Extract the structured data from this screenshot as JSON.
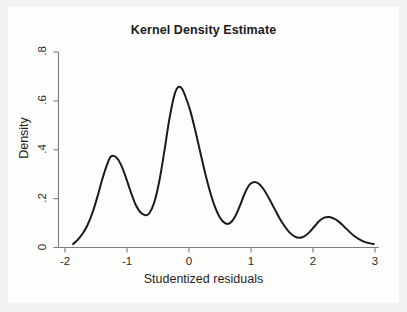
{
  "chart_data": {
    "type": "line",
    "title": "Kernel Density Estimate",
    "xlabel": "Studentized residuals",
    "ylabel": "Density",
    "xlim": [
      -2.0,
      3.0
    ],
    "ylim": [
      0.0,
      0.8
    ],
    "grid": false,
    "legend": null,
    "xticks": [
      "-2",
      "-1",
      "0",
      "1",
      "2",
      "3"
    ],
    "xtick_values": [
      -2,
      -1,
      0,
      1,
      2,
      3
    ],
    "yticks": [
      "0",
      ".2",
      ".4",
      ".6",
      ".8"
    ],
    "ytick_values": [
      0,
      0.2,
      0.4,
      0.6,
      0.8
    ],
    "series_name": "kdensity",
    "line_color": "#1a1a1a",
    "line_width": 2.0,
    "x": [
      -1.87,
      -1.8,
      -1.72,
      -1.64,
      -1.56,
      -1.48,
      -1.4,
      -1.32,
      -1.26,
      -1.18,
      -1.1,
      -1.02,
      -0.94,
      -0.86,
      -0.78,
      -0.7,
      -0.64,
      -0.56,
      -0.48,
      -0.4,
      -0.32,
      -0.24,
      -0.18,
      -0.12,
      -0.06,
      0.02,
      0.1,
      0.18,
      0.26,
      0.34,
      0.42,
      0.5,
      0.58,
      0.66,
      0.74,
      0.82,
      0.9,
      0.98,
      1.06,
      1.14,
      1.22,
      1.3,
      1.38,
      1.46,
      1.54,
      1.62,
      1.7,
      1.78,
      1.86,
      1.94,
      2.02,
      2.1,
      2.18,
      2.26,
      2.34,
      2.42,
      2.5,
      2.58,
      2.66,
      2.74,
      2.82,
      2.9,
      2.98
    ],
    "y": [
      0.014,
      0.03,
      0.055,
      0.09,
      0.14,
      0.205,
      0.278,
      0.34,
      0.372,
      0.37,
      0.34,
      0.288,
      0.228,
      0.175,
      0.143,
      0.132,
      0.14,
      0.185,
      0.27,
      0.39,
      0.52,
      0.62,
      0.655,
      0.652,
      0.62,
      0.56,
      0.48,
      0.392,
      0.305,
      0.228,
      0.165,
      0.122,
      0.1,
      0.1,
      0.125,
      0.17,
      0.222,
      0.258,
      0.268,
      0.258,
      0.232,
      0.196,
      0.158,
      0.12,
      0.088,
      0.062,
      0.046,
      0.04,
      0.046,
      0.062,
      0.085,
      0.108,
      0.122,
      0.125,
      0.118,
      0.105,
      0.086,
      0.066,
      0.048,
      0.034,
      0.024,
      0.018,
      0.014
    ],
    "peaks": [
      {
        "x": -1.26,
        "y": 0.372
      },
      {
        "x": -0.16,
        "y": 0.655
      },
      {
        "x": 1.0,
        "y": 0.268
      },
      {
        "x": 2.12,
        "y": 0.125
      }
    ],
    "valleys": [
      {
        "x": -0.7,
        "y": 0.132
      },
      {
        "x": 0.55,
        "y": 0.099
      },
      {
        "x": 1.78,
        "y": 0.04
      }
    ]
  }
}
